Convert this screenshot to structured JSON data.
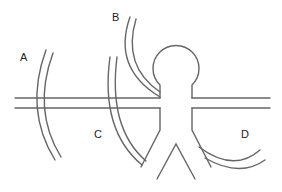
{
  "diagram": {
    "labels": {
      "a": "A",
      "b": "B",
      "c": "C",
      "d": "D"
    },
    "colors": {
      "stroke": "#666666",
      "text": "#222222",
      "background": "#ffffff"
    }
  }
}
